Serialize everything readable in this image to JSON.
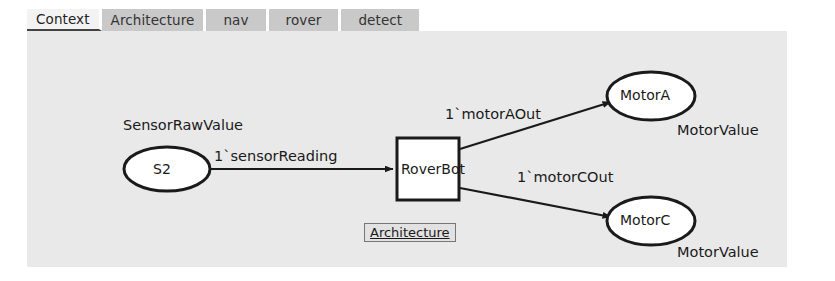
{
  "tabs": [
    {
      "label": "Context",
      "selected": true,
      "wide": false
    },
    {
      "label": "Architecture",
      "selected": false,
      "wide": false
    },
    {
      "label": "nav",
      "selected": false,
      "wide": true
    },
    {
      "label": "rover",
      "selected": false,
      "wide": true
    },
    {
      "label": "detect",
      "selected": false,
      "wide": true
    }
  ],
  "diagram": {
    "type": "petri-net",
    "background_color": "#e9e9e9",
    "places": [
      {
        "id": "S2",
        "label": "S2",
        "colour_set": "SensorRawValue",
        "shape": "ellipse",
        "cx": 140,
        "cy": 138,
        "rx": 43,
        "ry": 22
      },
      {
        "id": "MotorA",
        "label": "MotorA",
        "colour_set": "MotorValue",
        "shape": "ellipse",
        "cx": 624,
        "cy": 65,
        "rx": 44,
        "ry": 24
      },
      {
        "id": "MotorC",
        "label": "MotorC",
        "colour_set": "MotorValue",
        "shape": "ellipse",
        "cx": 624,
        "cy": 190,
        "rx": 44,
        "ry": 24
      }
    ],
    "transitions": [
      {
        "id": "RoverBot",
        "label": "RoverBot",
        "shape": "rectangle",
        "x": 370,
        "y": 105,
        "w": 62,
        "h": 62,
        "substitution_tag": "Architecture"
      }
    ],
    "arcs": [
      {
        "from": "S2",
        "to": "RoverBot",
        "label": "1`sensorReading"
      },
      {
        "from": "RoverBot",
        "to": "MotorA",
        "label": "1`motorAOut"
      },
      {
        "from": "RoverBot",
        "to": "MotorC",
        "label": "1`motorCOut"
      }
    ],
    "labels": {
      "sensor_colour_set": "SensorRawValue",
      "motora_colour_set": "MotorValue",
      "motorc_colour_set": "MotorValue",
      "s2_name": "S2",
      "motora_name": "MotorA",
      "motorc_name": "MotorC",
      "roverbot_name": "RoverBot",
      "arch_tag": "Architecture",
      "arc_sensor": "1`sensorReading",
      "arc_motora": "1`motorAOut",
      "arc_motorc": "1`motorCOut"
    }
  }
}
